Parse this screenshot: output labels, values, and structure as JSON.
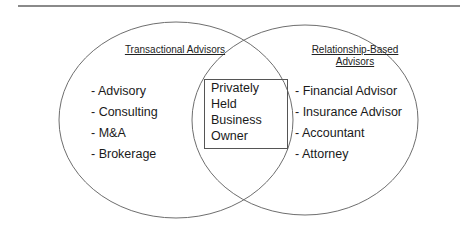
{
  "diagram": {
    "type": "venn",
    "left_set": {
      "title": "Transactional Advisors",
      "items": [
        "- Advisory",
        "- Consulting",
        "- M&A",
        "- Brokerage"
      ]
    },
    "right_set": {
      "title_line1": "Relationship-Based",
      "title_line2": "Advisors",
      "items": [
        "- Financial Advisor",
        "- Insurance Advisor",
        "- Accountant",
        "- Attorney"
      ]
    },
    "intersection": {
      "lines": [
        "Privately",
        "Held",
        "Business",
        "Owner"
      ]
    },
    "colors": {
      "outline": "#6e6e6e",
      "text": "#1a1a1a",
      "rule": "#8a8a8a"
    }
  }
}
